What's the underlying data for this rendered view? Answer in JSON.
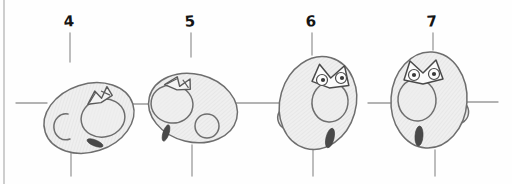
{
  "sheet": {
    "title": "Head Rotation Sketch Sheet",
    "medium": "pencil sketch",
    "width": 512,
    "height": 184,
    "background_color": "#fefefe",
    "left_border": {
      "name": "sheet-left-border",
      "x": 4,
      "y1": 0,
      "y2": 184,
      "color": "#b9b9b9",
      "width": 1.4
    },
    "palette": {
      "paper": "#fefefe",
      "ink": "#6e6e6e",
      "ink_dark": "#4a4a4a",
      "shade_fill": "#eeeeee",
      "shade_fill_dark": "#e2e2e2",
      "pupil": "#3a3a3a",
      "guide": "#9a9a9a",
      "label_text": "#151515"
    }
  },
  "guides": {
    "name": "registration-crosshairs",
    "horizontal_center_y": 103,
    "horizontal_color": "#9a9a9a",
    "horizontal_width": 1.3,
    "vertical_color": "#9a9a9a",
    "vertical_width": 1.3,
    "tick_top_y1": 33,
    "tick_top_y2": 62,
    "tick_bottom_y1": 148,
    "tick_bottom_y2": 176,
    "horizontal_segments": [
      {
        "x1": 16,
        "x2": 47
      },
      {
        "x1": 133,
        "x2": 155
      },
      {
        "x1": 229,
        "x2": 283
      },
      {
        "x1": 368,
        "x2": 398
      },
      {
        "x1": 466,
        "x2": 498
      }
    ]
  },
  "frames": [
    {
      "label": "4",
      "label_x": 69,
      "label_y": 22,
      "guide_x": 70,
      "pose": "three-quarter-back, tilted",
      "head": {
        "cx": 89,
        "cy": 118,
        "rx": 46,
        "ry": 34,
        "rotation": -18
      },
      "ear": {
        "type": "c-shape",
        "cx": 60,
        "cy": 126,
        "r": 12,
        "rotation": 20
      },
      "mouth": {
        "type": "open-circle",
        "cx": 103,
        "cy": 118,
        "rx": 22,
        "ry": 19,
        "rotation": -12
      },
      "brow": {
        "type": "angry-v-back",
        "cx": 97,
        "cy": 96,
        "scale": 1.0,
        "rotation": -18
      },
      "eye_dark": {
        "cx": 95,
        "cy": 143,
        "rx": 8,
        "ry": 3,
        "rotation": 22
      }
    },
    {
      "label": "5",
      "label_x": 190,
      "label_y": 22,
      "guide_x": 191,
      "pose": "three-quarter-back mirrored, tilted",
      "head": {
        "cx": 193,
        "cy": 108,
        "rx": 45,
        "ry": 34,
        "rotation": 14
      },
      "ear": {
        "type": "o-shape",
        "cx": 206,
        "cy": 126,
        "r": 12,
        "rotation": 0
      },
      "mouth": {
        "type": "open-circle",
        "cx": 172,
        "cy": 104,
        "rx": 21,
        "ry": 19,
        "rotation": 10
      },
      "brow": {
        "type": "angry-v-back",
        "cx": 177,
        "cy": 83,
        "scale": 1.0,
        "rotation": 12
      },
      "eye_dark": {
        "cx": 166,
        "cy": 133,
        "rx": 3,
        "ry": 8,
        "rotation": 18
      }
    },
    {
      "label": "6",
      "label_x": 311,
      "label_y": 22,
      "guide_x": 312,
      "pose": "three-quarter front, left ear",
      "head": {
        "cx": 318,
        "cy": 103,
        "rx": 38,
        "ry": 47,
        "rotation": 16
      },
      "ear": {
        "type": "bump-left",
        "cx": 285,
        "cy": 115,
        "r": 11
      },
      "brow": {
        "type": "angry-v-front",
        "cx": 331,
        "cy": 73,
        "scale": 1.0,
        "rotation": 10
      },
      "eyes": [
        {
          "cx": 322,
          "cy": 79,
          "r": 5.5,
          "pupil_r": 2.0
        },
        {
          "cx": 340,
          "cy": 77,
          "r": 5.5,
          "pupil_r": 2.0
        }
      ],
      "mouth": {
        "type": "open-oval",
        "cx": 330,
        "cy": 102,
        "rx": 18,
        "ry": 20,
        "rotation": 8
      },
      "chin_dark": {
        "cx": 330,
        "cy": 138,
        "rx": 4,
        "ry": 10,
        "rotation": 14
      }
    },
    {
      "label": "7",
      "label_x": 432,
      "label_y": 22,
      "guide_x": 433,
      "pose": "near-frontal, right ear",
      "head": {
        "cx": 429,
        "cy": 100,
        "rx": 38,
        "ry": 48,
        "rotation": 4
      },
      "ear": {
        "type": "bump-right",
        "cx": 464,
        "cy": 110,
        "r": 11
      },
      "brow": {
        "type": "angry-v-front",
        "cx": 424,
        "cy": 68,
        "scale": 1.0,
        "rotation": 0
      },
      "eyes": [
        {
          "cx": 414,
          "cy": 74,
          "r": 5.5,
          "pupil_r": 2.0
        },
        {
          "cx": 434,
          "cy": 74,
          "r": 5.5,
          "pupil_r": 2.0
        }
      ],
      "mouth": {
        "type": "open-oval",
        "cx": 417,
        "cy": 100,
        "rx": 19,
        "ry": 21,
        "rotation": -4
      },
      "chin_dark": {
        "cx": 419,
        "cy": 136,
        "rx": 4,
        "ry": 10,
        "rotation": 4
      }
    }
  ]
}
